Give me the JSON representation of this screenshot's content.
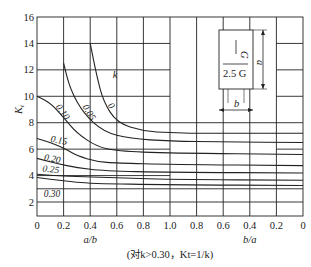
{
  "chart_data": {
    "type": "line",
    "title": "",
    "ylabel": "Kt",
    "xlabel_left": "a/b",
    "xlabel_right": "b/a",
    "note": "(对k>0.30，Kt=1/k)",
    "ylim": [
      1,
      16
    ],
    "yticks": [
      "2",
      "4",
      "6",
      "8",
      "10",
      "12",
      "14",
      "16"
    ],
    "xticks": [
      "0",
      "0.2",
      "0.4",
      "0.6",
      "0.8",
      "1.0",
      "0.8",
      "0.6",
      "0.4",
      "0.2",
      "0"
    ],
    "legend_param": "k",
    "grid": true,
    "series": [
      {
        "name": "0",
        "points": [
          [
            0.4,
            14.0
          ],
          [
            0.45,
            11.5
          ],
          [
            0.5,
            9.6
          ],
          [
            0.6,
            8.0
          ],
          [
            0.8,
            7.35
          ],
          [
            1.0,
            7.25
          ],
          [
            1.2,
            7.2
          ],
          [
            1.6,
            7.2
          ],
          [
            2.0,
            7.2
          ]
        ]
      },
      {
        "name": "0.05",
        "points": [
          [
            0.2,
            12.5
          ],
          [
            0.25,
            10.5
          ],
          [
            0.35,
            8.7
          ],
          [
            0.5,
            7.3
          ],
          [
            0.7,
            6.8
          ],
          [
            1.0,
            6.6
          ],
          [
            1.4,
            6.55
          ],
          [
            2.0,
            6.5
          ]
        ]
      },
      {
        "name": "0.10",
        "points": [
          [
            0.0,
            10.0
          ],
          [
            0.1,
            9.5
          ],
          [
            0.2,
            8.4
          ],
          [
            0.3,
            7.2
          ],
          [
            0.45,
            6.2
          ],
          [
            0.6,
            5.85
          ],
          [
            1.0,
            5.7
          ],
          [
            2.0,
            5.6
          ]
        ]
      },
      {
        "name": "0.15",
        "points": [
          [
            0.0,
            6.8
          ],
          [
            0.1,
            6.5
          ],
          [
            0.2,
            6.1
          ],
          [
            0.3,
            5.5
          ],
          [
            0.45,
            5.05
          ],
          [
            0.6,
            4.95
          ],
          [
            1.0,
            4.85
          ],
          [
            2.0,
            4.75
          ]
        ]
      },
      {
        "name": "0.20",
        "points": [
          [
            0.0,
            5.3
          ],
          [
            0.15,
            4.9
          ],
          [
            0.3,
            4.6
          ],
          [
            0.5,
            4.35
          ],
          [
            1.0,
            4.25
          ],
          [
            2.0,
            4.2
          ]
        ]
      },
      {
        "name": "0.25",
        "points": [
          [
            0.0,
            4.1
          ],
          [
            0.2,
            3.95
          ],
          [
            0.4,
            3.9
          ],
          [
            0.55,
            3.85
          ],
          [
            1.0,
            3.7
          ],
          [
            2.0,
            3.65
          ]
        ]
      },
      {
        "name": "0.30",
        "points": [
          [
            0.0,
            3.85
          ],
          [
            0.2,
            3.6
          ],
          [
            0.4,
            3.4
          ],
          [
            1.0,
            3.3
          ],
          [
            2.0,
            3.25
          ]
        ]
      }
    ],
    "horizontal_lines_right": [
      7.2,
      6.5,
      5.6,
      4.75,
      4.2,
      3.85,
      3.65,
      3.25,
      3.0,
      2.0
    ],
    "inset": {
      "top_label": "G",
      "bottom_label": "2.5 G",
      "dim_a": "a",
      "dim_b": "b"
    }
  }
}
